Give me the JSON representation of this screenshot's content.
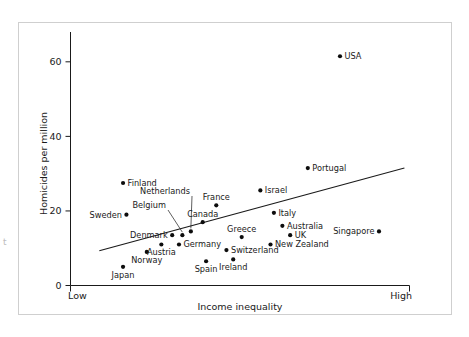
{
  "figure": {
    "edge_glyph": "t",
    "frame_color": "#cfcfcf"
  },
  "chart_data": {
    "type": "scatter",
    "title": "",
    "xlabel": "Income inequality",
    "ylabel": "Homicides per million",
    "grid": false,
    "legend": "none",
    "x_axis": {
      "low_label": "Low",
      "high_label": "High",
      "ticks": [],
      "range_labels": [
        "Low",
        "High"
      ]
    },
    "y_axis": {
      "ticks": [
        0,
        20,
        40,
        60
      ],
      "tick_labels": [
        "0",
        "20",
        "40",
        "60"
      ],
      "ylim": [
        0,
        68
      ]
    },
    "points": [
      {
        "name": "USA",
        "x": 0.795,
        "y": 61.5,
        "label_pos": "right"
      },
      {
        "name": "Portugal",
        "x": 0.7,
        "y": 31.5,
        "label_pos": "right"
      },
      {
        "name": "Finland",
        "x": 0.155,
        "y": 27.5,
        "label_pos": "right"
      },
      {
        "name": "Israel",
        "x": 0.56,
        "y": 25.5,
        "label_pos": "right"
      },
      {
        "name": "France",
        "x": 0.43,
        "y": 21.5,
        "label_pos": "above"
      },
      {
        "name": "Italy",
        "x": 0.6,
        "y": 19.5,
        "label_pos": "right"
      },
      {
        "name": "Sweden",
        "x": 0.165,
        "y": 19.0,
        "label_pos": "left"
      },
      {
        "name": "Netherlands",
        "x": 0.355,
        "y": 14.5,
        "label_pos": "leader-up"
      },
      {
        "name": "Canada",
        "x": 0.39,
        "y": 17.0,
        "label_pos": "above"
      },
      {
        "name": "Australia",
        "x": 0.625,
        "y": 16.0,
        "label_pos": "right"
      },
      {
        "name": "Singapore",
        "x": 0.91,
        "y": 14.5,
        "label_pos": "left"
      },
      {
        "name": "Belgium",
        "x": 0.33,
        "y": 13.5,
        "label_pos": "leader-up"
      },
      {
        "name": "UK",
        "x": 0.648,
        "y": 13.5,
        "label_pos": "right"
      },
      {
        "name": "Denmark",
        "x": 0.3,
        "y": 13.5,
        "label_pos": "left"
      },
      {
        "name": "Greece",
        "x": 0.505,
        "y": 13.0,
        "label_pos": "above"
      },
      {
        "name": "Germany",
        "x": 0.32,
        "y": 11.0,
        "label_pos": "right"
      },
      {
        "name": "Austria",
        "x": 0.268,
        "y": 11.0,
        "label_pos": "below"
      },
      {
        "name": "New Zealand",
        "x": 0.59,
        "y": 11.0,
        "label_pos": "right"
      },
      {
        "name": "Switzerland",
        "x": 0.46,
        "y": 9.5,
        "label_pos": "right"
      },
      {
        "name": "Norway",
        "x": 0.225,
        "y": 9.0,
        "label_pos": "below"
      },
      {
        "name": "Ireland",
        "x": 0.48,
        "y": 7.0,
        "label_pos": "below"
      },
      {
        "name": "Spain",
        "x": 0.4,
        "y": 6.5,
        "label_pos": "below"
      },
      {
        "name": "Japan",
        "x": 0.155,
        "y": 5.0,
        "label_pos": "below"
      }
    ],
    "trendline": {
      "x_start": 0.085,
      "y_start": 9.3,
      "x_end": 0.985,
      "y_end": 31.5
    },
    "annotations": []
  }
}
